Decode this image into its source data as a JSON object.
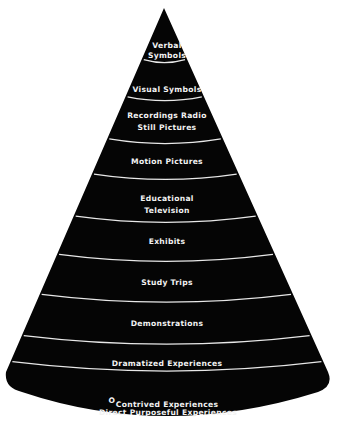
{
  "colors": {
    "cone": "#050505",
    "separator": "#e8e8e8",
    "text": "#f2f2f2",
    "background": "#ffffff"
  },
  "bands": [
    {
      "id": "verbal-symbols",
      "lines": [
        "Verbal",
        "Symbols"
      ]
    },
    {
      "id": "visual-symbols",
      "lines": [
        "Visual Symbols"
      ]
    },
    {
      "id": "recordings-radio-still-pictures",
      "lines": [
        "Recordings   Radio",
        "Still Pictures"
      ]
    },
    {
      "id": "motion-pictures",
      "lines": [
        "Motion Pictures"
      ]
    },
    {
      "id": "educational-television",
      "lines": [
        "Educational",
        "Television"
      ]
    },
    {
      "id": "exhibits",
      "lines": [
        "Exhibits"
      ]
    },
    {
      "id": "study-trips",
      "lines": [
        "Study Trips"
      ]
    },
    {
      "id": "demonstrations",
      "lines": [
        "Demonstrations"
      ]
    },
    {
      "id": "dramatized-experiences",
      "lines": [
        "Dramatized Experiences"
      ]
    },
    {
      "id": "contrived-experiences",
      "lines": [
        "Contrived Experiences"
      ]
    },
    {
      "id": "direct-purposeful-experiences",
      "lines": [
        "O",
        "Direct  Purposeful Experiences"
      ]
    }
  ]
}
